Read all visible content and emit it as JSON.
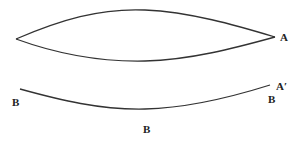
{
  "diagram": {
    "lens_shape": {
      "tip_left": [
        16,
        39
      ],
      "tip_right": [
        275,
        37
      ],
      "top_peak_y": 10,
      "bottom_low_y": 61
    },
    "lower_curve": {
      "start": [
        20,
        89
      ],
      "end": [
        270,
        85
      ],
      "low_y": 109
    },
    "labels": {
      "a": "A",
      "a_prime": "A′",
      "b_left": "B",
      "b_right": "B",
      "b_bottom": "B"
    },
    "stroke_color": "#333333"
  }
}
